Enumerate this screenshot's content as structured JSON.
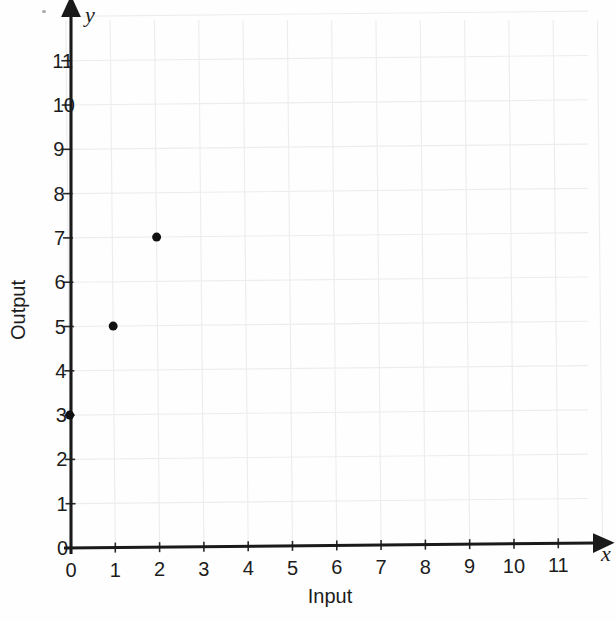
{
  "chart_data": {
    "type": "scatter",
    "title": "",
    "subtitle": "",
    "xlabel": "Input",
    "ylabel": "Output",
    "x_axis_letter": "x",
    "y_axis_letter": "y",
    "xlim": [
      0,
      11.8
    ],
    "ylim": [
      0,
      11.8
    ],
    "x_ticks": [
      0,
      1,
      2,
      3,
      4,
      5,
      6,
      7,
      8,
      9,
      10,
      11
    ],
    "y_ticks": [
      0,
      1,
      2,
      3,
      4,
      5,
      6,
      7,
      8,
      9,
      10,
      11
    ],
    "x_tick_labels": [
      "0",
      "1",
      "2",
      "3",
      "4",
      "5",
      "6",
      "7",
      "8",
      "9",
      "10",
      "11"
    ],
    "y_tick_labels": [
      "0",
      "1",
      "2",
      "3",
      "4",
      "5",
      "6",
      "7",
      "8",
      "9",
      "10",
      "11"
    ],
    "grid": true,
    "grid_color": "#ededed",
    "legend": false,
    "legend_position": "none",
    "axis_color": "#1a1a1a",
    "marker_color": "#111111",
    "marker_size": 9,
    "points": [
      {
        "x": 0,
        "y": 3,
        "label": "(0, 3)"
      },
      {
        "x": 1,
        "y": 5,
        "label": "(1, 5)"
      },
      {
        "x": 2,
        "y": 7,
        "label": "(2, 7)"
      }
    ],
    "series": [
      {
        "name": "",
        "x": [
          0,
          1,
          2
        ],
        "y": [
          3,
          5,
          7
        ]
      }
    ],
    "annotations": []
  },
  "geometry": {
    "origin_x": 71,
    "origin_y": 548,
    "unit_x": 44.3,
    "unit_y": 44.3,
    "grid_top": 20,
    "grid_right": 588,
    "y_axis_top": 14,
    "x_axis_right": 596,
    "tilt_deg": -0.55
  }
}
